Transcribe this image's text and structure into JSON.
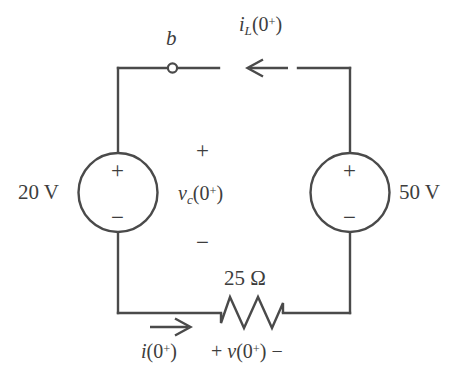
{
  "figure": {
    "kind": "circuit-schematic"
  },
  "components": {
    "source_left": {
      "name": "20 V independent voltage source",
      "label": "20 V",
      "plus": "+",
      "minus": "−"
    },
    "source_right": {
      "name": "50 V independent voltage source",
      "label": "50 V",
      "plus": "+",
      "minus": "−"
    },
    "resistor": {
      "name": "25 ohm resistor",
      "label_value": "25",
      "label_unit": "Ω",
      "label": "25 Ω"
    },
    "switch": {
      "name": "open switch terminal b",
      "terminal_label": "b"
    }
  },
  "annotations": {
    "inductor_current": {
      "var": "i",
      "sub": "L",
      "arg": "(0",
      "sup": "+",
      "close": ")",
      "full": "i_L(0+)"
    },
    "capacitor_voltage": {
      "var": "v",
      "sub": "c",
      "arg": "(0",
      "sup": "+",
      "close": ")",
      "full": "v_c(0+)",
      "polarity_plus": "+",
      "polarity_minus": "−"
    },
    "mesh_current": {
      "var": "i",
      "arg": "(0",
      "sup": "+",
      "close": ")",
      "full": "i(0+)"
    },
    "resistor_voltage": {
      "polarity_plus": "+",
      "var": "v",
      "arg": "(0",
      "sup": "+",
      "close": ")",
      "polarity_minus": "−",
      "full": "+ v(0+) −"
    }
  },
  "colors": {
    "wire": "#4a4a4a",
    "text": "#3d3d3d",
    "background": "#ffffff"
  }
}
